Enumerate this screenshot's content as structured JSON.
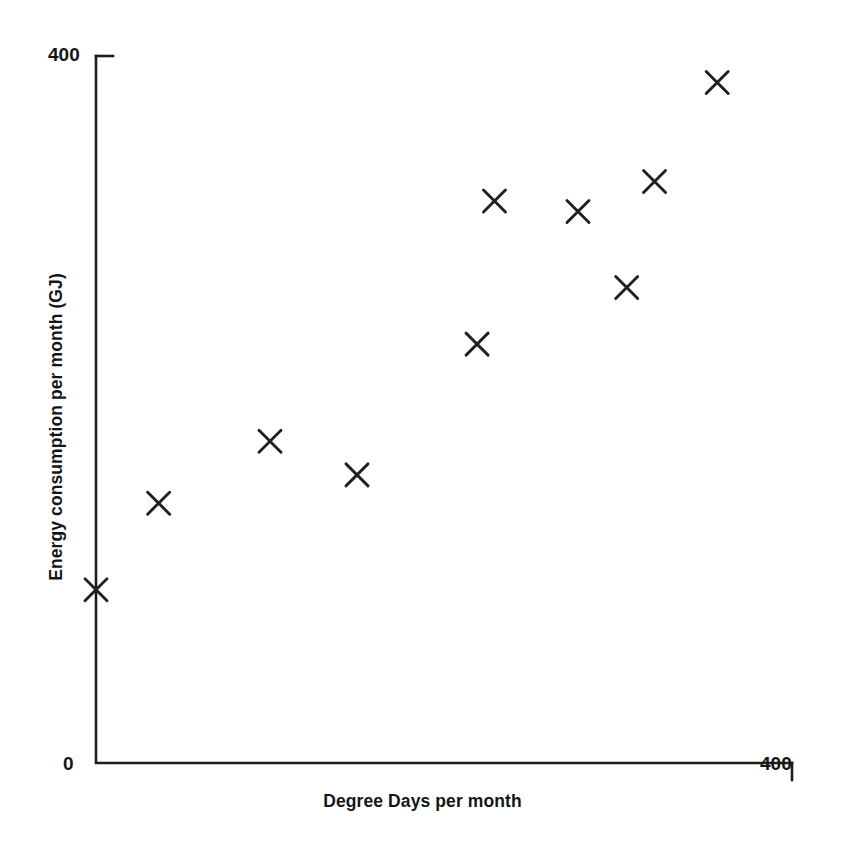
{
  "chart_data": {
    "type": "scatter",
    "title": "",
    "xlabel": "Degree Days per month",
    "ylabel": "Energy consumption per month (GJ)",
    "xlim": [
      0,
      400
    ],
    "ylim": [
      0,
      400
    ],
    "grid": false,
    "legend": null,
    "xticks": [
      0,
      400
    ],
    "yticks": [
      400
    ],
    "xtick_labels": [
      "0",
      "400"
    ],
    "ytick_labels": [
      "400"
    ],
    "marker": "x",
    "marker_color": "#202020",
    "series": [
      {
        "name": "Monthly energy vs degree days",
        "points": [
          {
            "x": 0,
            "y": 98
          },
          {
            "x": 36,
            "y": 147
          },
          {
            "x": 100,
            "y": 182
          },
          {
            "x": 150,
            "y": 163
          },
          {
            "x": 219,
            "y": 237
          },
          {
            "x": 229,
            "y": 318
          },
          {
            "x": 277,
            "y": 312
          },
          {
            "x": 305,
            "y": 269
          },
          {
            "x": 321,
            "y": 329
          },
          {
            "x": 357,
            "y": 385
          }
        ]
      }
    ]
  },
  "axes": {
    "y_max_label": "400",
    "origin_label": "0",
    "x_max_label": "400",
    "x_title": "Degree Days per month",
    "y_title": "Energy consumption per month (GJ)"
  },
  "colors": {
    "background": "#ffffff",
    "axis": "#1d1d1d",
    "marker": "#202020",
    "text": "#151515"
  }
}
